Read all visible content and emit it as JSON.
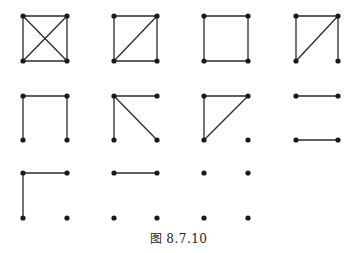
{
  "caption": "图 8.7.10",
  "colors": {
    "stroke": "#2a2a2a",
    "node": "#1a1a1a",
    "background": "#ffffff"
  },
  "layout": {
    "columns_x": [
      [
        23,
        67
      ],
      [
        114,
        157
      ],
      [
        204,
        248
      ],
      [
        296,
        338
      ]
    ],
    "rows_y": [
      [
        16,
        61
      ],
      [
        96,
        140
      ],
      [
        173,
        218
      ]
    ]
  },
  "graphs": [
    {
      "id": "g1",
      "row": 0,
      "col": 0,
      "edges": [
        [
          "TL",
          "TR"
        ],
        [
          "BL",
          "BR"
        ],
        [
          "TL",
          "BL"
        ],
        [
          "TR",
          "BR"
        ],
        [
          "TL",
          "BR"
        ],
        [
          "TR",
          "BL"
        ]
      ]
    },
    {
      "id": "g2",
      "row": 0,
      "col": 1,
      "edges": [
        [
          "TL",
          "TR"
        ],
        [
          "BL",
          "BR"
        ],
        [
          "TL",
          "BL"
        ],
        [
          "TR",
          "BR"
        ],
        [
          "BL",
          "TR"
        ]
      ]
    },
    {
      "id": "g3",
      "row": 0,
      "col": 2,
      "edges": [
        [
          "TL",
          "TR"
        ],
        [
          "BL",
          "BR"
        ],
        [
          "TL",
          "BL"
        ],
        [
          "TR",
          "BR"
        ]
      ]
    },
    {
      "id": "g4",
      "row": 0,
      "col": 3,
      "edges": [
        [
          "TL",
          "TR"
        ],
        [
          "TL",
          "BL"
        ],
        [
          "BL",
          "TR"
        ],
        [
          "TR",
          "BR"
        ]
      ]
    },
    {
      "id": "g5",
      "row": 1,
      "col": 0,
      "edges": [
        [
          "TL",
          "TR"
        ],
        [
          "TL",
          "BL"
        ],
        [
          "TR",
          "BR"
        ]
      ]
    },
    {
      "id": "g6",
      "row": 1,
      "col": 1,
      "edges": [
        [
          "TL",
          "TR"
        ],
        [
          "TL",
          "BL"
        ],
        [
          "TL",
          "BR"
        ]
      ]
    },
    {
      "id": "g7",
      "row": 1,
      "col": 2,
      "edges": [
        [
          "TL",
          "TR"
        ],
        [
          "TL",
          "BL"
        ],
        [
          "BL",
          "TR"
        ]
      ]
    },
    {
      "id": "g8",
      "row": 1,
      "col": 3,
      "edges": [
        [
          "TL",
          "TR"
        ],
        [
          "BL",
          "BR"
        ]
      ]
    },
    {
      "id": "g9",
      "row": 2,
      "col": 0,
      "edges": [
        [
          "TL",
          "TR"
        ],
        [
          "TL",
          "BL"
        ]
      ]
    },
    {
      "id": "g10",
      "row": 2,
      "col": 1,
      "edges": [
        [
          "TL",
          "TR"
        ]
      ]
    },
    {
      "id": "g11",
      "row": 2,
      "col": 2,
      "edges": []
    }
  ]
}
